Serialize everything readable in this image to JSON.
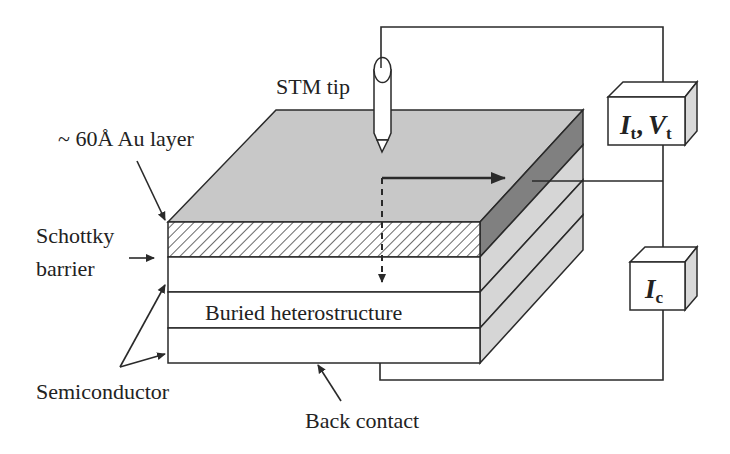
{
  "diagram": {
    "labels": {
      "stm_tip": "STM tip",
      "au_layer": "~ 60Å Au layer",
      "schottky_line1": "Schottky",
      "schottky_line2": "barrier",
      "buried": "Buried heterostructure",
      "semiconductor": "Semiconductor",
      "back_contact": "Back contact"
    },
    "instruments": {
      "tunnel_meter": {
        "I": "I",
        "I_sub": "t",
        "sep": ",",
        "V": "V",
        "V_sub": "t"
      },
      "collector_meter": {
        "I": "I",
        "I_sub": "c"
      }
    },
    "colors": {
      "line": "#2a2a2a",
      "top_face": "#c8c8c8",
      "side_face": "#d6d6d6",
      "au_side": "#808080",
      "hatch": "#6a6a6a",
      "box_side": "#d9d9d9"
    }
  }
}
